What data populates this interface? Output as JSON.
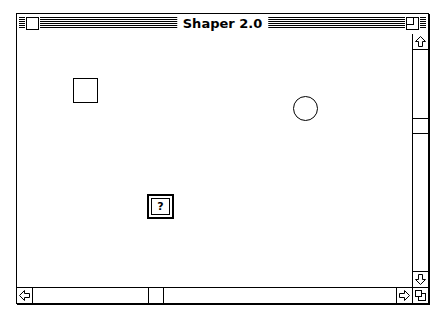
{
  "window": {
    "title": "Shaper 2.0",
    "close_box": "close-box-icon",
    "zoom_box": "zoom-box-icon"
  },
  "canvas": {
    "shapes": [
      {
        "type": "square",
        "label": ""
      },
      {
        "type": "circle",
        "label": ""
      },
      {
        "type": "unknown-shape",
        "label": "?"
      }
    ]
  },
  "scrollbars": {
    "vertical": {
      "position_fraction": 0.33,
      "up_icon": "arrow-up-icon",
      "down_icon": "arrow-down-icon"
    },
    "horizontal": {
      "position_fraction": 0.33,
      "left_icon": "arrow-left-icon",
      "right_icon": "arrow-right-icon"
    },
    "grow_icon": "grow-box-icon"
  }
}
